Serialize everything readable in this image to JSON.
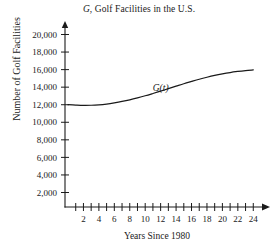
{
  "chart_data": {
    "type": "line",
    "title": "G, Golf Facilities in the U.S.",
    "title_italic_part": "G",
    "title_rest": ", Golf Facilities in the U.S.",
    "xlabel": "Years Since 1980",
    "ylabel": "Number of Golf Facilities",
    "series_label": "G(t)",
    "grid": false,
    "legend": "inline-curve-label",
    "xlim": [
      0,
      25
    ],
    "ylim": [
      0,
      21000
    ],
    "x_tick_step": 1,
    "x_labeled_ticks": [
      2,
      4,
      6,
      8,
      10,
      12,
      14,
      16,
      18,
      20,
      22,
      24
    ],
    "x_tick_labels": [
      "2",
      "4",
      "6",
      "8",
      "10",
      "12",
      "14",
      "16",
      "18",
      "20",
      "22",
      "24"
    ],
    "y_ticks": [
      2000,
      4000,
      6000,
      8000,
      10000,
      12000,
      14000,
      16000,
      18000,
      20000
    ],
    "y_tick_labels": [
      "2,000",
      "4,000",
      "6,000",
      "8,000",
      "10,000",
      "12,000",
      "14,000",
      "16,000",
      "18,000",
      "20,000"
    ],
    "x": [
      0,
      1,
      2,
      3,
      4,
      5,
      6,
      7,
      8,
      9,
      10,
      11,
      12,
      13,
      14,
      15,
      16,
      17,
      18,
      19,
      20,
      21,
      22,
      23,
      24
    ],
    "values": [
      12000,
      11960,
      11930,
      11940,
      11990,
      12080,
      12210,
      12370,
      12560,
      12780,
      13020,
      13280,
      13550,
      13830,
      14110,
      14390,
      14650,
      14900,
      15130,
      15340,
      15520,
      15670,
      15790,
      15890,
      15970
    ],
    "series": [
      {
        "name": "G(t)",
        "values": [
          12000,
          11960,
          11930,
          11940,
          11990,
          12080,
          12210,
          12370,
          12560,
          12780,
          13020,
          13280,
          13550,
          13830,
          14110,
          14390,
          14650,
          14900,
          15130,
          15340,
          15520,
          15670,
          15790,
          15890,
          15970
        ]
      }
    ],
    "annotations": [
      {
        "text": "G(t)",
        "x": 12.0,
        "y": 13600,
        "style": "italic"
      }
    ],
    "colors": {
      "curve": "#1a1a1a",
      "axis": "#1a1a1a",
      "text": "#1a1a1a",
      "background": "#ffffff"
    }
  }
}
